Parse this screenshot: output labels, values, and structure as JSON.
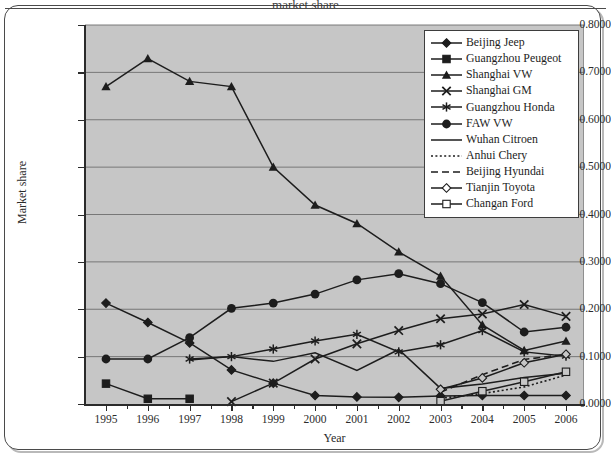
{
  "figure": {
    "title_sliver": "market share",
    "background": "#ffffff",
    "plot_background": "#c6c6c6",
    "line_color": "#1d1d1d",
    "axis_color": "#2b2b2b",
    "gridline_color": "#6e6e6e"
  },
  "axes": {
    "ylabel": "Market share",
    "xlabel": "Year",
    "yticks": [
      "0.0000",
      "0.1000",
      "0.2000",
      "0.3000",
      "0.4000",
      "0.5000",
      "0.6000",
      "0.7000",
      "0.8000"
    ],
    "ytick_values": [
      0.0,
      0.1,
      0.2,
      0.3,
      0.4,
      0.5,
      0.6,
      0.7,
      0.8
    ],
    "xticks": [
      "1995",
      "1996",
      "1997",
      "1998",
      "1999",
      "2000",
      "2001",
      "2002",
      "2003",
      "2004",
      "2005",
      "2006"
    ]
  },
  "legend": {
    "position": "top-right-inside",
    "items": [
      {
        "label": "Beijing Jeep",
        "marker": "diamond-filled",
        "line": "solid"
      },
      {
        "label": "Guangzhou Peugeot",
        "marker": "square-filled",
        "line": "solid"
      },
      {
        "label": "Shanghai VW",
        "marker": "triangle-filled",
        "line": "solid"
      },
      {
        "label": "Shanghai GM",
        "marker": "cross-x",
        "line": "solid"
      },
      {
        "label": "Guangzhou Honda",
        "marker": "asterisk",
        "line": "solid"
      },
      {
        "label": "FAW VW",
        "marker": "circle-filled",
        "line": "solid"
      },
      {
        "label": "Wuhan Citroen",
        "marker": "none",
        "line": "solid"
      },
      {
        "label": "Anhui Chery",
        "marker": "none",
        "line": "dotted"
      },
      {
        "label": "Beijing Hyundai",
        "marker": "none",
        "line": "dashed"
      },
      {
        "label": "Tianjin Toyota",
        "marker": "diamond-open",
        "line": "solid"
      },
      {
        "label": "Changan Ford",
        "marker": "square-open",
        "line": "solid"
      }
    ]
  },
  "chart_data": {
    "type": "line",
    "title": "",
    "xlabel": "Year",
    "ylabel": "Market share",
    "categories": [
      1995,
      1996,
      1997,
      1998,
      1999,
      2000,
      2001,
      2002,
      2003,
      2004,
      2005,
      2006
    ],
    "xlim": [
      1995,
      2006
    ],
    "ylim": [
      0.0,
      0.8
    ],
    "grid": "horizontal",
    "legend_position": "upper right inside plot",
    "series": [
      {
        "name": "Beijing Jeep",
        "marker": "diamond-filled",
        "line": "solid",
        "x": [
          1995,
          1996,
          1997,
          1998,
          1999,
          2000,
          2001,
          2002,
          2003,
          2004,
          2005,
          2006
        ],
        "values": [
          0.213,
          0.172,
          0.129,
          0.072,
          0.044,
          0.018,
          0.015,
          0.014,
          0.017,
          0.018,
          0.018,
          0.018
        ]
      },
      {
        "name": "Guangzhou Peugeot",
        "marker": "square-filled",
        "line": "solid",
        "x": [
          1995,
          1996,
          1997
        ],
        "values": [
          0.043,
          0.011,
          0.011
        ]
      },
      {
        "name": "Shanghai VW",
        "marker": "triangle-filled",
        "line": "solid",
        "x": [
          1995,
          1996,
          1997,
          1998,
          1999,
          2000,
          2001,
          2002,
          2003,
          2004,
          2005,
          2006
        ],
        "values": [
          0.67,
          0.729,
          0.681,
          0.67,
          0.5,
          0.42,
          0.381,
          0.321,
          0.27,
          0.167,
          0.113,
          0.133
        ]
      },
      {
        "name": "Shanghai GM",
        "marker": "cross-x",
        "line": "solid",
        "x": [
          1998,
          1999,
          2000,
          2001,
          2002,
          2003,
          2004,
          2005,
          2006
        ],
        "values": [
          0.005,
          0.044,
          0.095,
          0.127,
          0.155,
          0.18,
          0.19,
          0.21,
          0.185
        ]
      },
      {
        "name": "Guangzhou Honda",
        "marker": "asterisk",
        "line": "solid",
        "x": [
          1997,
          1998,
          1999,
          2000,
          2001,
          2002,
          2003,
          2004,
          2005,
          2006
        ],
        "values": [
          0.095,
          0.1,
          0.116,
          0.133,
          0.147,
          0.11,
          0.125,
          0.155,
          0.11,
          0.101
        ]
      },
      {
        "name": "FAW VW",
        "marker": "circle-filled",
        "line": "solid",
        "x": [
          1995,
          1996,
          1997,
          1998,
          1999,
          2000,
          2001,
          2002,
          2003,
          2004,
          2005,
          2006
        ],
        "values": [
          0.095,
          0.095,
          0.14,
          0.202,
          0.213,
          0.232,
          0.262,
          0.275,
          0.254,
          0.214,
          0.152,
          0.162
        ]
      },
      {
        "name": "Wuhan Citroen",
        "marker": "none",
        "line": "solid",
        "x": [
          1997,
          1998,
          1999,
          2000,
          2001,
          2002,
          2003,
          2004,
          2005,
          2006
        ],
        "values": [
          0.093,
          0.1,
          0.09,
          0.108,
          0.071,
          0.115,
          0.033,
          0.042,
          0.056,
          0.065
        ]
      },
      {
        "name": "Anhui Chery",
        "marker": "none",
        "line": "dotted",
        "x": [
          2003,
          2004,
          2005,
          2006
        ],
        "values": [
          0.012,
          0.022,
          0.036,
          0.061
        ]
      },
      {
        "name": "Beijing Hyundai",
        "marker": "none",
        "line": "dashed",
        "x": [
          2003,
          2004,
          2005,
          2006
        ],
        "values": [
          0.025,
          0.062,
          0.094,
          0.105
        ]
      },
      {
        "name": "Tianjin Toyota",
        "marker": "diamond-open",
        "line": "solid",
        "x": [
          2003,
          2004,
          2005,
          2006
        ],
        "values": [
          0.031,
          0.055,
          0.087,
          0.105
        ]
      },
      {
        "name": "Changan Ford",
        "marker": "square-open",
        "line": "solid",
        "x": [
          2003,
          2004,
          2005,
          2006
        ],
        "values": [
          0.006,
          0.027,
          0.047,
          0.068
        ]
      }
    ]
  }
}
